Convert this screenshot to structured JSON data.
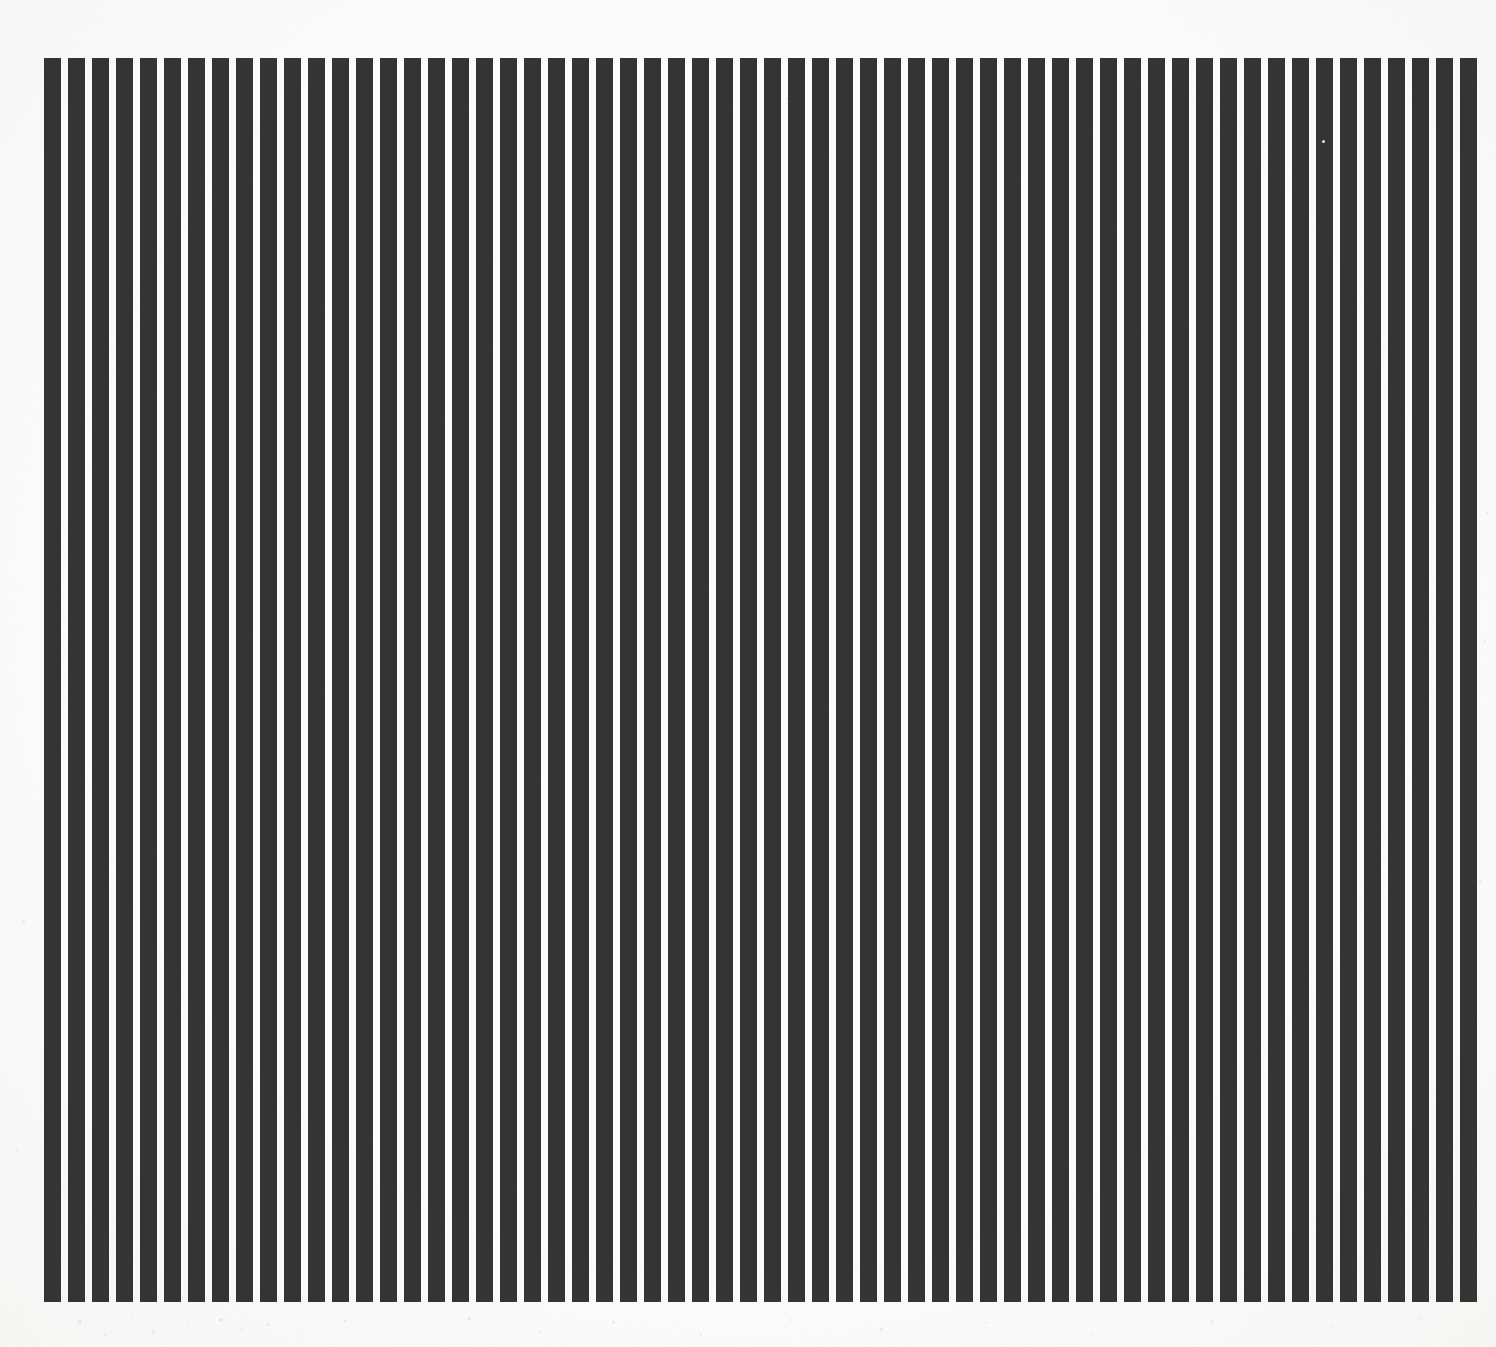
{
  "artwork": {
    "title": "Vertical Stripe Composition",
    "medium_description": "Hard-edge vertical black bars on off-white paper",
    "canvas": {
      "width": 1496,
      "height": 1347,
      "background_color": "#fdfdfc"
    }
  },
  "chart_data": {
    "type": "bar",
    "subtitle": "",
    "xlabel": "",
    "ylabel": "",
    "grid": false,
    "legend_position": "none",
    "orientation": "vertical",
    "bar_color": "#343331",
    "background_color": "#fdfdfc",
    "bar_count": 60,
    "bar_width_px": 17,
    "bar_gap_px": 7,
    "bar_pitch_px": 24,
    "field_left_px": 44,
    "field_right_px": 1474,
    "field_top_px": 58,
    "field_bottom_px": 1302,
    "field_width_px": 1430,
    "field_height_px": 1244,
    "xlim": [
      0,
      60
    ],
    "ylim": [
      0,
      1
    ],
    "categories": [
      "1",
      "2",
      "3",
      "4",
      "5",
      "6",
      "7",
      "8",
      "9",
      "10",
      "11",
      "12",
      "13",
      "14",
      "15",
      "16",
      "17",
      "18",
      "19",
      "20",
      "21",
      "22",
      "23",
      "24",
      "25",
      "26",
      "27",
      "28",
      "29",
      "30",
      "31",
      "32",
      "33",
      "34",
      "35",
      "36",
      "37",
      "38",
      "39",
      "40",
      "41",
      "42",
      "43",
      "44",
      "45",
      "46",
      "47",
      "48",
      "49",
      "50",
      "51",
      "52",
      "53",
      "54",
      "55",
      "56",
      "57",
      "58",
      "59",
      "60"
    ],
    "values": [
      1,
      1,
      1,
      1,
      1,
      1,
      1,
      1,
      1,
      1,
      1,
      1,
      1,
      1,
      1,
      1,
      1,
      1,
      1,
      1,
      1,
      1,
      1,
      1,
      1,
      1,
      1,
      1,
      1,
      1,
      1,
      1,
      1,
      1,
      1,
      1,
      1,
      1,
      1,
      1,
      1,
      1,
      1,
      1,
      1,
      1,
      1,
      1,
      1,
      1,
      1,
      1,
      1,
      1,
      1,
      1,
      1,
      1,
      1,
      1
    ],
    "tick_labels": [],
    "annotations": []
  },
  "paper": {
    "tone_color": "#f6f5f2",
    "speck_color": "#e9e8e4",
    "specks": [
      {
        "x": 78,
        "y": 1320,
        "size": 4
      },
      {
        "x": 104,
        "y": 1333,
        "size": 3
      },
      {
        "x": 131,
        "y": 1316,
        "size": 2
      },
      {
        "x": 152,
        "y": 1330,
        "size": 3
      },
      {
        "x": 186,
        "y": 1322,
        "size": 2
      },
      {
        "x": 219,
        "y": 1318,
        "size": 4
      },
      {
        "x": 241,
        "y": 1329,
        "size": 2
      },
      {
        "x": 266,
        "y": 1323,
        "size": 3
      },
      {
        "x": 301,
        "y": 1335,
        "size": 2
      },
      {
        "x": 343,
        "y": 1319,
        "size": 3
      },
      {
        "x": 404,
        "y": 1327,
        "size": 2
      },
      {
        "x": 468,
        "y": 1317,
        "size": 3
      },
      {
        "x": 540,
        "y": 1331,
        "size": 2
      },
      {
        "x": 612,
        "y": 1321,
        "size": 3
      },
      {
        "x": 700,
        "y": 1334,
        "size": 2
      },
      {
        "x": 790,
        "y": 1319,
        "size": 2
      },
      {
        "x": 880,
        "y": 1328,
        "size": 3
      },
      {
        "x": 985,
        "y": 1322,
        "size": 2
      },
      {
        "x": 1090,
        "y": 1333,
        "size": 2
      },
      {
        "x": 1210,
        "y": 1320,
        "size": 3
      },
      {
        "x": 1330,
        "y": 1326,
        "size": 2
      },
      {
        "x": 1420,
        "y": 1318,
        "size": 2
      },
      {
        "x": 22,
        "y": 920,
        "size": 3
      },
      {
        "x": 16,
        "y": 1150,
        "size": 2
      },
      {
        "x": 1484,
        "y": 640,
        "size": 2
      },
      {
        "x": 1479,
        "y": 880,
        "size": 3
      },
      {
        "x": 1322,
        "y": 140,
        "size": 3
      },
      {
        "x": 1486,
        "y": 512,
        "size": 2
      },
      {
        "x": 786,
        "y": 98,
        "size": 2
      }
    ]
  }
}
